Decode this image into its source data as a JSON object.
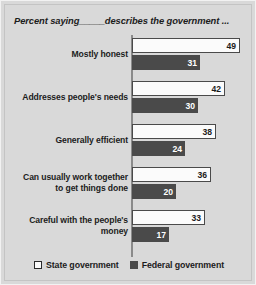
{
  "chart_data": {
    "type": "bar",
    "title": "Percent saying_____describes the government ...",
    "orientation": "horizontal",
    "xlabel": "",
    "ylabel": "",
    "xlim": [
      0,
      49
    ],
    "grid": false,
    "legend_position": "bottom-center",
    "categories": [
      "Mostly honest",
      "Addresses people's needs",
      "Generally efficient",
      "Can usually work together to get things done",
      "Careful with the people's money"
    ],
    "category_lines": [
      [
        "Mostly honest"
      ],
      [
        "Addresses people's needs"
      ],
      [
        "Generally efficient"
      ],
      [
        "Can usually work together",
        "to get things done"
      ],
      [
        "Careful with the people's",
        "money"
      ]
    ],
    "series": [
      {
        "name": "State government",
        "color": "#fbfbfb",
        "values": [
          49,
          42,
          38,
          36,
          33
        ]
      },
      {
        "name": "Federal government",
        "color": "#4a4a4a",
        "values": [
          31,
          30,
          24,
          20,
          17
        ]
      }
    ]
  },
  "legend": {
    "items": [
      {
        "label": "State government",
        "swatch": "state"
      },
      {
        "label": "Federal government",
        "swatch": "federal"
      }
    ]
  }
}
